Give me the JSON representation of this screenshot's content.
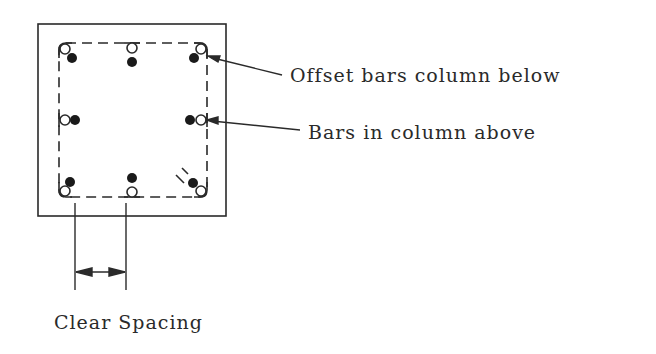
{
  "diagram": {
    "type": "column splice reinforcement plan",
    "labels": {
      "offset_bars": "Offset bars column below",
      "bars_above": "Bars in column above",
      "clear_spacing": "Clear Spacing"
    },
    "legend": {
      "open_circle": "bar (hollow)",
      "filled_circle": "bar (solid)"
    },
    "colors": {
      "line": "#2a2a2a",
      "background": "#ffffff"
    }
  }
}
